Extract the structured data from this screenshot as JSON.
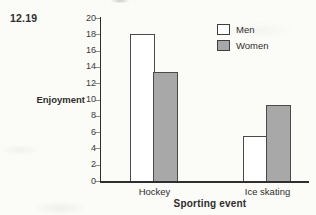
{
  "figure_label": "12.19",
  "chart_data": {
    "type": "bar",
    "categories": [
      "Hockey",
      "Ice skating"
    ],
    "series": [
      {
        "name": "Men",
        "values": [
          18,
          5.5
        ],
        "fill": "#ffffff"
      },
      {
        "name": "Women",
        "values": [
          13.4,
          9.3
        ],
        "fill": "#a8a8a8"
      }
    ],
    "xlabel": "Sporting event",
    "ylabel": "Enjoyment",
    "ylim": [
      0,
      20
    ],
    "ytick_step": 2,
    "yticks": [
      0,
      2,
      4,
      6,
      8,
      10,
      12,
      14,
      16,
      18,
      20
    ],
    "grid": false,
    "legend_position": "top-right",
    "bar_border_color": "#4a4a4a",
    "axis_color": "#2f2f2f"
  }
}
